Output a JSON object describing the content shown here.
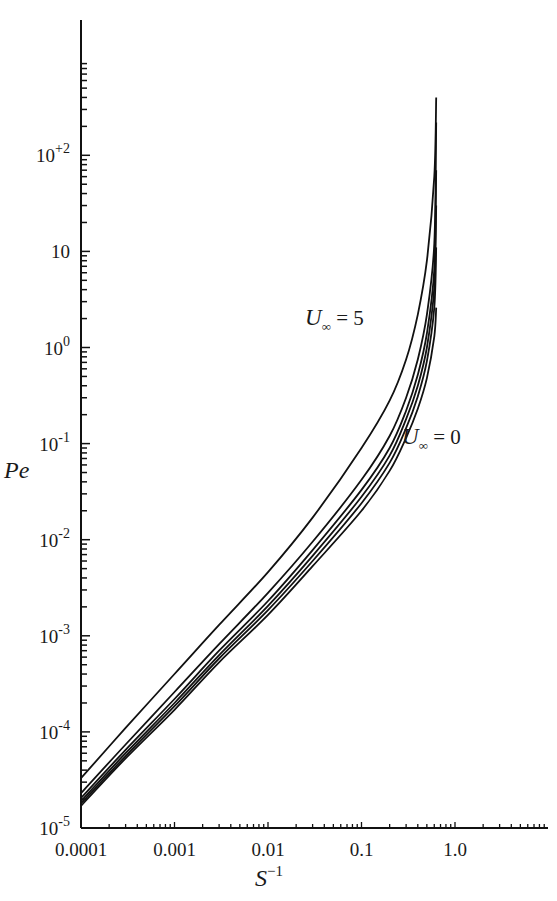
{
  "chart_data": {
    "type": "line",
    "title": "",
    "xlabel": "S^-1",
    "ylabel": "Pe",
    "xscale": "log",
    "yscale": "log",
    "xlim": [
      0.0001,
      10
    ],
    "ylim": [
      1e-05,
      500
    ],
    "grid": false,
    "legend": "none",
    "x_tick_labels": [
      "0.0001",
      "0.001",
      "0.01",
      "0.1",
      "1.0"
    ],
    "x_tick_values": [
      0.0001,
      0.001,
      0.01,
      0.1,
      1.0
    ],
    "y_tick_labels": [
      {
        "base": "10",
        "exp": "+2",
        "value": 100
      },
      {
        "base": "10",
        "exp": "",
        "value": 10
      },
      {
        "base": "10",
        "exp": "0",
        "value": 1
      },
      {
        "base": "10",
        "exp": "-1",
        "value": 0.1
      },
      {
        "base": "10",
        "exp": "-2",
        "value": 0.01
      },
      {
        "base": "10",
        "exp": "-3",
        "value": 0.001
      },
      {
        "base": "10",
        "exp": "-4",
        "value": 0.0001
      },
      {
        "base": "10",
        "exp": "-5",
        "value": 1e-05
      }
    ],
    "annotations": [
      {
        "text_main": "U",
        "text_sub": "∞",
        "text_rest": " = 5",
        "label": "U∞ = 5"
      },
      {
        "text_main": "U",
        "text_sub": "∞",
        "text_rest": " = 0",
        "label": "U∞ = 0"
      }
    ],
    "x": [
      0.0001,
      0.0003,
      0.001,
      0.003,
      0.01,
      0.03,
      0.1,
      0.2,
      0.3,
      0.4,
      0.5,
      0.6,
      0.63
    ],
    "series": [
      {
        "name": "U∞ = 5",
        "values": [
          3.3e-05,
          0.00011,
          0.0004,
          0.0013,
          0.0046,
          0.017,
          0.09,
          0.28,
          0.75,
          2.2,
          8.0,
          60,
          400
        ]
      },
      {
        "name": "U∞ (curve 2)",
        "values": [
          2.3e-05,
          7.4e-05,
          0.00026,
          0.00082,
          0.0028,
          0.0095,
          0.042,
          0.12,
          0.3,
          0.75,
          2.2,
          12,
          220
        ]
      },
      {
        "name": "U∞ (curve 3)",
        "values": [
          2.05e-05,
          6.5e-05,
          0.00022,
          0.0007,
          0.0023,
          0.0078,
          0.033,
          0.09,
          0.22,
          0.52,
          1.4,
          6.5,
          70
        ]
      },
      {
        "name": "U∞ (curve 4)",
        "values": [
          1.9e-05,
          6e-05,
          0.0002,
          0.00063,
          0.00205,
          0.0068,
          0.028,
          0.075,
          0.18,
          0.4,
          1.0,
          4.2,
          30
        ]
      },
      {
        "name": "U∞ (curve 5)",
        "values": [
          1.8e-05,
          5.6e-05,
          0.000185,
          0.00058,
          0.00185,
          0.006,
          0.024,
          0.063,
          0.145,
          0.31,
          0.72,
          2.6,
          11
        ]
      },
      {
        "name": "U∞ = 0",
        "values": [
          1.7e-05,
          5.3e-05,
          0.00017,
          0.00053,
          0.00165,
          0.0053,
          0.02,
          0.052,
          0.115,
          0.23,
          0.48,
          1.3,
          2.6
        ]
      }
    ]
  }
}
